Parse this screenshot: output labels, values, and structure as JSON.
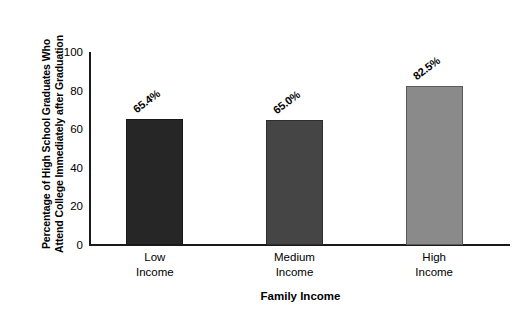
{
  "chart_data": {
    "type": "bar",
    "title": "",
    "subtitle": "",
    "xlabel": "Family Income",
    "ylabel_line1": "Percentage of High School Graduates Who",
    "ylabel_line2": "Attend College Immediately after Graduation",
    "categories": [
      "Low Income",
      "Medium Income",
      "High Income"
    ],
    "category_lines": [
      [
        "Low",
        "Income"
      ],
      [
        "Medium",
        "Income"
      ],
      [
        "High",
        "Income"
      ]
    ],
    "values": [
      65.4,
      65.0,
      82.5
    ],
    "data_labels": [
      "65.4%",
      "65.0%",
      "82.5%"
    ],
    "ylim": [
      0,
      100
    ],
    "yticks": [
      100,
      80,
      60,
      40,
      20,
      0
    ],
    "ytick_labels": [
      "100",
      "80",
      "60",
      "40",
      "20",
      "0"
    ],
    "grid": false,
    "legend": false,
    "legend_position": "none",
    "bar_colors": [
      "#262626",
      "#454545",
      "#8a8a8a"
    ],
    "axis_color": "#1a1a1a",
    "background_color": "#ffffff",
    "text_color": "#000000"
  }
}
